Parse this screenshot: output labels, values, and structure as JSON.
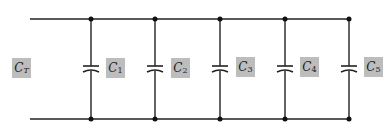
{
  "diagram": {
    "type": "parallel-capacitor-circuit",
    "total_label": {
      "main": "C",
      "sub": "T"
    },
    "capacitors": [
      {
        "main": "C",
        "sub": "1"
      },
      {
        "main": "C",
        "sub": "2"
      },
      {
        "main": "C",
        "sub": "3"
      },
      {
        "main": "C",
        "sub": "4"
      },
      {
        "main": "C",
        "sub": "5"
      }
    ],
    "colors": {
      "wire": "#222222",
      "label_bg": "#bdbdbd",
      "background": "#ffffff"
    }
  }
}
